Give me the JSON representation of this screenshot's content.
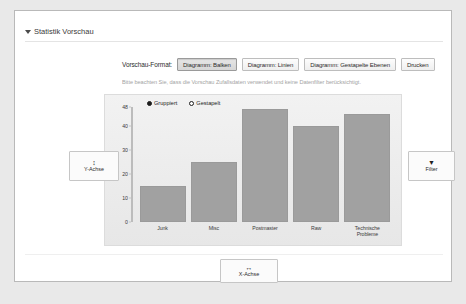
{
  "section": {
    "title": "Statistik Vorschau",
    "toggle_icon": "chevron-down-icon"
  },
  "toolbar": {
    "format_label": "Vorschau-Format:",
    "buttons": [
      {
        "label": "Diagramm: Balken",
        "active": true
      },
      {
        "label": "Diagramm: Linien",
        "active": false
      },
      {
        "label": "Diagramm: Gestapelte Ebenen",
        "active": false
      },
      {
        "label": "Drucken",
        "active": false
      }
    ]
  },
  "hint": {
    "text": "Bitte beachten Sie, dass die Vorschau Zufallsdaten verwendet und keine Datenfilter berücksichtigt."
  },
  "controls": {
    "y_axis": {
      "icon": "↕",
      "icon_name": "vertical-arrow-icon",
      "label": "Y-Achse"
    },
    "filter": {
      "icon": "▼",
      "icon_name": "funnel-icon",
      "label": "Filter"
    },
    "x_axis": {
      "icon": "↔",
      "icon_name": "horizontal-arrow-icon",
      "label": "X-Achse"
    }
  },
  "chart_data": {
    "type": "bar",
    "title": "",
    "xlabel": "",
    "ylabel": "",
    "categories": [
      "Junk",
      "Misc",
      "Postmaster",
      "Raw",
      "Technische Probleme"
    ],
    "values": [
      15,
      25,
      47,
      40,
      45
    ],
    "series": [
      {
        "name": "Gruppiert",
        "values": [
          15,
          25,
          47,
          40,
          45
        ]
      }
    ],
    "ylim": [
      0,
      48
    ],
    "yticks": [
      0,
      10,
      20,
      30,
      40,
      48
    ],
    "ytick_labels": [
      "0",
      "10",
      "20",
      "30",
      "40",
      "48"
    ],
    "grid": false,
    "legend_position": "top-left",
    "legend": [
      {
        "label": "Gruppiert",
        "marker": "filled"
      },
      {
        "label": "Gestapelt",
        "marker": "hollow"
      }
    ],
    "bar_color": "#a1a1a1",
    "axis_color": "#bcbcbc",
    "plot_background": "#eeeeee"
  }
}
